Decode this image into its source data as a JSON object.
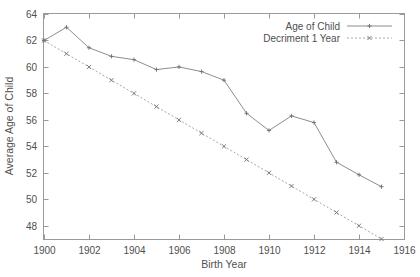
{
  "chart_data": {
    "type": "line",
    "title": "",
    "xlabel": "Birth Year",
    "ylabel": "Average Age of Child",
    "xlim": [
      1900,
      1916
    ],
    "ylim": [
      47,
      64
    ],
    "x_ticks": [
      "1900",
      "1902",
      "1904",
      "1906",
      "1908",
      "1910",
      "1912",
      "1914",
      "1916"
    ],
    "y_ticks": [
      "48",
      "50",
      "52",
      "54",
      "56",
      "58",
      "60",
      "62",
      "64"
    ],
    "grid": false,
    "legend_position": "top-right",
    "x": [
      1900,
      1901,
      1902,
      1903,
      1904,
      1905,
      1906,
      1907,
      1908,
      1909,
      1910,
      1911,
      1912,
      1913,
      1914,
      1915
    ],
    "series": [
      {
        "name": "Age of Child",
        "marker": "plus",
        "linestyle": "solid",
        "color": "#8d8d8d",
        "values": [
          62.0,
          63.0,
          61.45,
          60.8,
          60.55,
          59.8,
          60.0,
          59.65,
          59.0,
          56.5,
          55.2,
          56.3,
          55.8,
          52.8,
          51.85,
          50.95
        ]
      },
      {
        "name": "Decriment 1 Year",
        "marker": "cross",
        "linestyle": "dotted",
        "color": "#a8a8a8",
        "values": [
          62.0,
          61.0,
          60.0,
          59.0,
          58.0,
          57.0,
          56.0,
          55.0,
          54.0,
          53.0,
          52.0,
          51.0,
          50.0,
          49.0,
          48.0,
          47.0
        ]
      }
    ]
  },
  "legend": {
    "entries": [
      {
        "label": "Age of Child"
      },
      {
        "label": "Decriment 1 Year"
      }
    ]
  },
  "caption": {
    "text": ""
  }
}
